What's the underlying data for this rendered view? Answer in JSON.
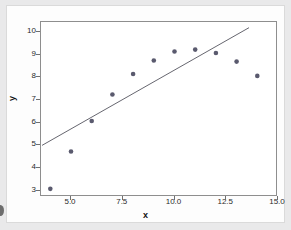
{
  "chart_data": {
    "type": "scatter",
    "title": "",
    "xlabel": "x",
    "ylabel": "y",
    "xlim": [
      3.55,
      15.0
    ],
    "ylim": [
      2.72,
      10.45
    ],
    "grid": false,
    "legend": null,
    "x": [
      4,
      5,
      6,
      7,
      8,
      9,
      10,
      11,
      12,
      13,
      14
    ],
    "y": [
      3.08,
      4.73,
      6.08,
      7.25,
      8.15,
      8.75,
      9.15,
      9.23,
      9.08,
      8.7,
      8.07
    ],
    "points": [
      {
        "x": 4,
        "y": 3.08
      },
      {
        "x": 5,
        "y": 4.73
      },
      {
        "x": 6,
        "y": 6.08
      },
      {
        "x": 7,
        "y": 7.25
      },
      {
        "x": 8,
        "y": 8.15
      },
      {
        "x": 9,
        "y": 8.75
      },
      {
        "x": 10,
        "y": 9.15
      },
      {
        "x": 11,
        "y": 9.23
      },
      {
        "x": 12,
        "y": 9.08
      },
      {
        "x": 13,
        "y": 8.7
      },
      {
        "x": 14,
        "y": 8.07
      }
    ],
    "series": [
      {
        "name": "observations",
        "type": "scatter",
        "marker": "filled-circle",
        "color": "#5a5a6e",
        "values": [
          3.08,
          4.73,
          6.08,
          7.25,
          8.15,
          8.75,
          9.15,
          9.23,
          9.08,
          8.7,
          8.07
        ]
      },
      {
        "name": "fit-line",
        "type": "line",
        "color": "#55555f",
        "x": [
          3.6,
          13.6
        ],
        "y": [
          5.0,
          10.2
        ]
      }
    ],
    "fit_line": {
      "x_start": 3.6,
      "y_start": 5.0,
      "x_end": 13.6,
      "y_end": 10.2,
      "slope": 0.52,
      "intercept": 3.13
    },
    "xticks": [
      5.0,
      7.5,
      10.0,
      12.5,
      15.0
    ],
    "xtick_labels": [
      "5.0",
      "7.5",
      "10.0",
      "12.5",
      "15.0"
    ],
    "yticks": [
      3,
      4,
      5,
      6,
      7,
      8,
      9,
      10
    ],
    "ytick_labels": [
      "3",
      "4",
      "5",
      "6",
      "7",
      "8",
      "9",
      "10"
    ]
  },
  "style": {
    "figure_background": "#e9e9ea",
    "panel_background": "#fdfdfd",
    "plot_background": "#ffffff",
    "frame_color": "#8e8e8e",
    "marker_color": "#5a5a6e",
    "line_color": "#55555f",
    "tick_text_color": "#2b2b2b",
    "axis_title_color": "#111111"
  }
}
